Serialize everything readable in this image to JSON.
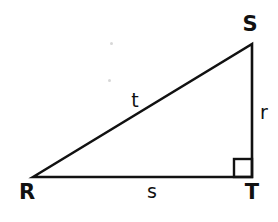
{
  "figure": {
    "kind": "geometry-diagram",
    "shape": "right-triangle",
    "background_color": "#ffffff",
    "stroke_color": "#111111",
    "stroke_width": 2.6,
    "canvas": {
      "width": 278,
      "height": 222
    }
  },
  "vertices": [
    {
      "id": "R",
      "label": "R",
      "point": {
        "x": 33,
        "y": 177
      },
      "label_pos": {
        "x": 27,
        "y": 192
      }
    },
    {
      "id": "S",
      "label": "S",
      "point": {
        "x": 252,
        "y": 44
      },
      "label_pos": {
        "x": 250,
        "y": 24
      }
    },
    {
      "id": "T",
      "label": "T",
      "point": {
        "x": 252,
        "y": 177
      },
      "label_pos": {
        "x": 252,
        "y": 192
      }
    }
  ],
  "sides": [
    {
      "id": "t",
      "label": "t",
      "from": "R",
      "to": "S",
      "role": "hypotenuse",
      "label_pos": {
        "x": 135,
        "y": 100
      }
    },
    {
      "id": "r",
      "label": "r",
      "from": "S",
      "to": "T",
      "role": "vertical-leg",
      "label_pos": {
        "x": 264,
        "y": 112
      }
    },
    {
      "id": "s",
      "label": "s",
      "from": "R",
      "to": "T",
      "role": "horizontal-leg",
      "label_pos": {
        "x": 152,
        "y": 191
      }
    }
  ],
  "right_angle": {
    "at_vertex": "T",
    "marker": "square",
    "size": 18,
    "x": 234,
    "y": 159
  },
  "artifacts": [
    {
      "name": "scan-speck",
      "x": 110,
      "y": 42,
      "size": 3
    },
    {
      "name": "scan-speck",
      "x": 108,
      "y": 79,
      "size": 3
    }
  ]
}
